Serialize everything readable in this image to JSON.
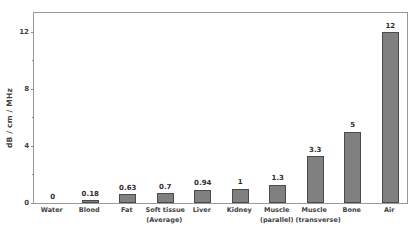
{
  "chart_data": {
    "type": "bar",
    "title": "",
    "xlabel": "",
    "ylabel": "dB / cm / MHz",
    "ylim": [
      0,
      13.5
    ],
    "grid": false,
    "legend": null,
    "y_ticks_major": [
      0,
      4,
      8,
      12
    ],
    "y_ticks_minor": [
      2,
      6,
      10
    ],
    "y_tick_labels": [
      "0",
      "4",
      "8",
      "12"
    ],
    "bar_color": "#808080",
    "bar_edge_color": "#4a4a4a",
    "frame_color": "#9a9a9a",
    "background": "#ffffff",
    "categories": [
      "Water",
      "Blood",
      "Fat",
      "Soft tissue (Average)",
      "Liver",
      "Kidney",
      "Muscle (parallel)",
      "Muscle (transverse)",
      "Bone",
      "Air"
    ],
    "category_lines": [
      [
        "Water",
        ""
      ],
      [
        "Blood",
        ""
      ],
      [
        "Fat",
        ""
      ],
      [
        "Soft tissue",
        "(Average)"
      ],
      [
        "Liver",
        ""
      ],
      [
        "Kidney",
        ""
      ],
      [
        "Muscle",
        "(parallel)"
      ],
      [
        "Muscle",
        "(transverse)"
      ],
      [
        "Bone",
        ""
      ],
      [
        "Air",
        ""
      ]
    ],
    "values": [
      0,
      0.18,
      0.63,
      0.7,
      0.94,
      1,
      1.3,
      3.3,
      5,
      12
    ],
    "value_labels": [
      "0",
      "0.18",
      "0.63",
      "0.7",
      "0.94",
      "1",
      "1.3",
      "3.3",
      "5",
      "12"
    ]
  }
}
